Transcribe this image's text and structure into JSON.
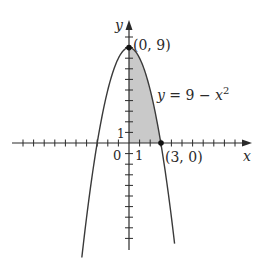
{
  "figure": {
    "type": "parabola-region-diagram",
    "colors": {
      "curve": "#3a3a3a",
      "axis": "#2a2a2a",
      "shade": "#c9c9c9",
      "point": "#111111"
    },
    "axes": {
      "x_label": "x",
      "y_label": "y",
      "origin_label": "0",
      "x_tick_label": "1",
      "y_tick_label": "1",
      "x_ticks": [
        -11,
        -10,
        -9,
        -8,
        -7,
        -6,
        -5,
        -4,
        -3,
        -2,
        -1,
        1,
        2,
        3,
        4,
        5,
        6,
        7,
        8,
        9,
        10,
        11
      ],
      "y_ticks": [
        -9,
        -8,
        -7,
        -6,
        -5,
        -4,
        -3,
        -2,
        -1,
        1,
        2,
        3,
        4,
        5,
        6,
        7,
        8,
        9,
        10
      ]
    },
    "curve": {
      "equation_lhs": "y = 9 − ",
      "equation_var": "x",
      "equation_exp": "2",
      "x_range": [
        -4.45,
        4.3
      ]
    },
    "points": [
      {
        "label": "(0, 9)",
        "x": 0,
        "y": 9
      },
      {
        "label": "(3, 0)",
        "x": 3,
        "y": 0
      }
    ],
    "shaded_region": {
      "description": "Area under y = 9 − x^2 in the first quadrant",
      "x_from": 0,
      "x_to": 3
    }
  },
  "chart_data": {
    "type": "line",
    "title": "",
    "xlabel": "x",
    "ylabel": "y",
    "series": [
      {
        "name": "y = 9 − x^2",
        "x": [
          -4.4,
          -4,
          -3,
          -2,
          -1,
          0,
          1,
          2,
          3,
          4,
          4.3
        ],
        "values": [
          -10.36,
          -7,
          0,
          5,
          8,
          9,
          8,
          5,
          0,
          -7,
          -9.49
        ]
      }
    ],
    "annotations": [
      "(0, 9)",
      "(3, 0)",
      "y = 9 − x²"
    ],
    "shaded": {
      "from_x": 0,
      "to_x": 3,
      "between": "curve and x-axis"
    },
    "xlim": [
      -12,
      12
    ],
    "ylim": [
      -10,
      11
    ],
    "grid": false
  }
}
